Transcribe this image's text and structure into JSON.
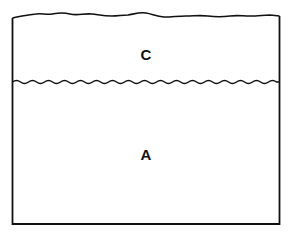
{
  "diagram": {
    "title": "",
    "regions": [
      {
        "id": "upper",
        "label": "C"
      },
      {
        "id": "lower",
        "label": "A"
      }
    ],
    "colors": {
      "stroke": "#111111",
      "background": "#ffffff"
    }
  }
}
